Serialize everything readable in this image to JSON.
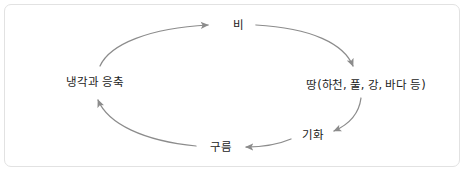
{
  "diagram": {
    "type": "cycle-diagram",
    "direction": "clockwise",
    "colors": {
      "background": "#ffffff",
      "panel_border": "#e2e2e2",
      "arrow": "#8c8c8c",
      "text": "#1c1c1c"
    },
    "nodes": [
      {
        "id": "rain",
        "label": "비",
        "position": "top"
      },
      {
        "id": "ground",
        "label": "땅(하천, 풀, 강, 바다 등)",
        "position": "right"
      },
      {
        "id": "evaporation",
        "label": "기화",
        "position": "bottom-right"
      },
      {
        "id": "cloud",
        "label": "구름",
        "position": "bottom"
      },
      {
        "id": "condensation",
        "label": "냉각과 응축",
        "position": "left"
      }
    ],
    "edges": [
      {
        "from": "condensation",
        "to": "rain",
        "arrow": "arrowhead-right"
      },
      {
        "from": "rain",
        "to": "ground",
        "arrow": "arrowhead-down-right"
      },
      {
        "from": "ground",
        "to": "evaporation",
        "arrow": "arrowhead-down-left"
      },
      {
        "from": "evaporation",
        "to": "cloud",
        "arrow": "arrowhead-left"
      },
      {
        "from": "cloud",
        "to": "condensation",
        "arrow": "arrowhead-up-left"
      }
    ]
  }
}
